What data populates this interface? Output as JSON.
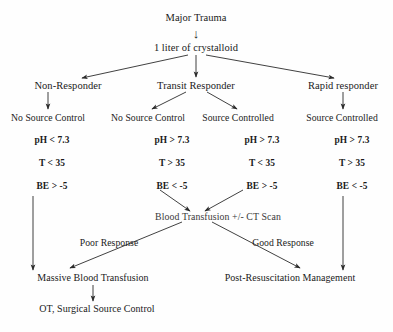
{
  "diagram": {
    "title_node": "Major Trauma",
    "resuscitation_node": "1 liter of crystalloid",
    "down_arrow_glyph": "↓",
    "responder_nodes": [
      {
        "label": "Non-Responder"
      },
      {
        "label": "Transit Responder"
      },
      {
        "label": "Rapid responder"
      }
    ],
    "source_control_headers": [
      {
        "label": "No Source Control"
      },
      {
        "label": "No Source Control"
      },
      {
        "label": "Source Controlled"
      },
      {
        "label": "Source Controlled"
      }
    ],
    "lab_columns": [
      {
        "ph": "pH < 7.3",
        "temp": "T < 35",
        "be": "BE > -5"
      },
      {
        "ph": "pH > 7.3",
        "temp": "T > 35",
        "be": "BE < -5"
      },
      {
        "ph": "pH > 7.3",
        "temp": "T < 35",
        "be": "BE > -5"
      },
      {
        "ph": "pH > 7.3",
        "temp": "T > 35",
        "be": "BE < -5"
      }
    ],
    "transfusion_node": "Blood Transfusion +/- CT Scan",
    "edge_labels": {
      "poor": "Poor Response",
      "good": "Good Response"
    },
    "outcomes": {
      "massive": "Massive Blood Transfusion",
      "surgical": "OT, Surgical Source Control",
      "post_resus": "Post-Resuscitation Management"
    }
  },
  "colors": {
    "ink": "#1a1a1a",
    "edge": "#333333",
    "paper": "#fefefe"
  }
}
